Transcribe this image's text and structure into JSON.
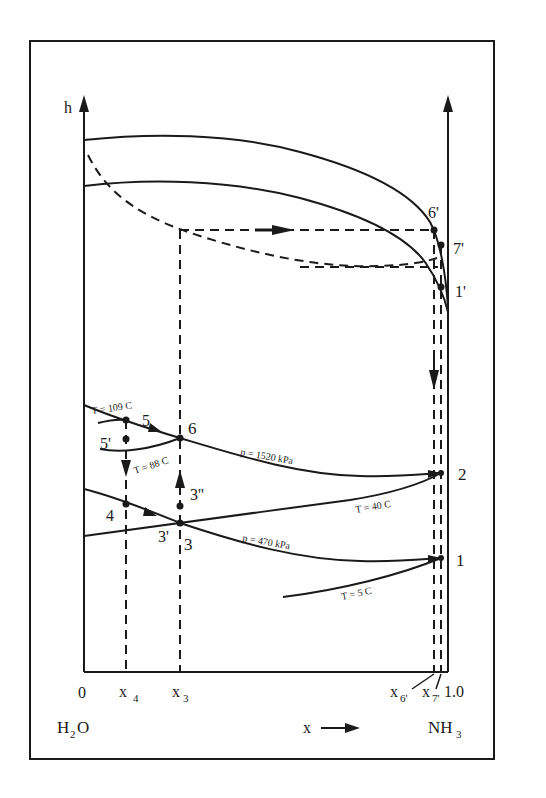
{
  "diagram": {
    "type": "enthalpy-concentration diagram (h-x) for ammonia-water",
    "y_axis_label": "h",
    "x_axis": {
      "label": "x",
      "arrow": "→",
      "ticks": [
        "0",
        "x",
        "x",
        "x",
        "x",
        "1.0"
      ],
      "tick_0": "0",
      "tick_x4": "x",
      "tick_x4_sub": "4",
      "tick_x3": "x",
      "tick_x3_sub": "3",
      "tick_x6": "x",
      "tick_x6_sub": "6'",
      "tick_x7": "x",
      "tick_x7_sub": "7'",
      "tick_end": "1.0"
    },
    "left_component": {
      "main": "H",
      "sub": "2",
      "tail": "O"
    },
    "right_component": {
      "main": "NH",
      "sub": "3"
    },
    "state_points": {
      "p1": "1",
      "p1_prime": "1'",
      "p2": "2",
      "p3": "3",
      "p3_prime": "3'",
      "p3_dprime": "3''",
      "p4": "4",
      "p5": "5",
      "p5_prime": "5'",
      "p6": "6",
      "p6_prime": "6'",
      "p7_prime": "7'"
    },
    "isobar_labels": {
      "high": "p = 1520 kPa",
      "low": "p = 470 kPa"
    },
    "isotherm_labels": {
      "t109": "T = 109 C",
      "t88": "T = 88 C",
      "t40": "T = 40 C",
      "t5": "T = 5 C"
    },
    "colors": {
      "ink": "#1a1a1a",
      "background": "#ffffff"
    }
  }
}
